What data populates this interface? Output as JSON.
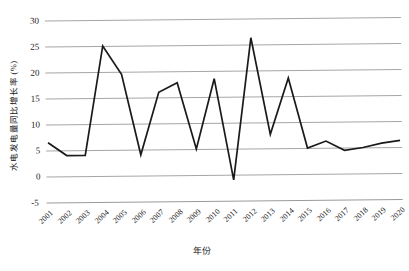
{
  "chart_data": {
    "type": "line",
    "title": "",
    "xlabel": "年份",
    "ylabel": "水电发电量同比增长率 (%)",
    "categories": [
      "2001",
      "2002",
      "2003",
      "2004",
      "2005",
      "2006",
      "2007",
      "2008",
      "2009",
      "2010",
      "2011",
      "2012",
      "2013",
      "2014",
      "2015",
      "2016",
      "2017",
      "2018",
      "2019",
      "2020"
    ],
    "values": [
      6.5,
      4.0,
      4.0,
      25.0,
      19.5,
      4.0,
      16.0,
      17.8,
      5.0,
      18.5,
      -1.0,
      26.3,
      7.7,
      18.5,
      5.0,
      6.3,
      4.5,
      5.0,
      5.8,
      6.3
    ],
    "series": [
      {
        "name": "水电发电量同比增长率",
        "values": [
          6.5,
          4.0,
          4.0,
          25.0,
          19.5,
          4.0,
          16.0,
          17.8,
          5.0,
          18.5,
          -1.0,
          26.3,
          7.7,
          18.5,
          5.0,
          6.3,
          4.5,
          5.0,
          5.8,
          6.3
        ]
      }
    ],
    "ylim": [
      -5,
      30
    ],
    "yticks": [
      "30",
      "25",
      "20",
      "15",
      "10",
      "5",
      "0",
      "-5"
    ],
    "ytick_values": [
      30,
      25,
      20,
      15,
      10,
      5,
      0,
      -5
    ],
    "grid": true,
    "legend": "none",
    "line_color": "#1a1a1a"
  },
  "axis": {
    "y_title": "水电发电量同比增长率 (%)",
    "x_title": "年份"
  }
}
